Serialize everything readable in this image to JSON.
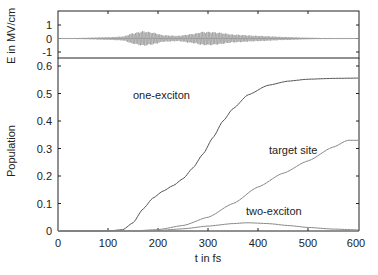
{
  "chart_data": [
    {
      "type": "line",
      "panel": "top",
      "title": "",
      "xlabel": "",
      "ylabel": "E in MV/cm",
      "xlim": [
        0,
        600
      ],
      "ylim": [
        -1.6,
        1.6
      ],
      "yticks": [
        "1",
        "0",
        "-1"
      ],
      "series": [
        {
          "name": "electric field envelope",
          "description": "oscillating pulse train; two main pulses centered near t=170 fs and t=305 fs, amplitude about 0.5 MV/cm",
          "t": [
            0,
            50,
            100,
            130,
            150,
            170,
            190,
            210,
            240,
            270,
            290,
            305,
            320,
            350,
            400,
            450,
            500,
            550,
            600
          ],
          "amplitude": [
            0.0,
            0.05,
            0.1,
            0.15,
            0.4,
            0.55,
            0.45,
            0.25,
            0.2,
            0.35,
            0.5,
            0.5,
            0.45,
            0.3,
            0.2,
            0.12,
            0.06,
            0.02,
            0.0
          ]
        }
      ]
    },
    {
      "type": "line",
      "panel": "bottom",
      "title": "",
      "xlabel": "t in fs",
      "ylabel": "Population",
      "xlim": [
        0,
        600
      ],
      "ylim": [
        0,
        0.6
      ],
      "xticks": [
        "0",
        "100",
        "200",
        "300",
        "400",
        "500",
        "600"
      ],
      "yticks": [
        "0",
        "0.1",
        "0.2",
        "0.3",
        "0.4",
        "0.5",
        "0.6"
      ],
      "grid": false,
      "series": [
        {
          "name": "one-exciton",
          "t": [
            0,
            100,
            130,
            150,
            170,
            190,
            210,
            230,
            250,
            270,
            290,
            310,
            330,
            350,
            380,
            420,
            460,
            500,
            550,
            600
          ],
          "values": [
            0,
            0,
            0.005,
            0.03,
            0.08,
            0.12,
            0.145,
            0.165,
            0.19,
            0.23,
            0.28,
            0.34,
            0.4,
            0.445,
            0.495,
            0.53,
            0.545,
            0.552,
            0.555,
            0.556
          ]
        },
        {
          "name": "target site",
          "t": [
            0,
            150,
            200,
            250,
            300,
            350,
            400,
            450,
            500,
            550,
            580,
            600
          ],
          "values": [
            0,
            0,
            0.005,
            0.02,
            0.05,
            0.1,
            0.16,
            0.21,
            0.255,
            0.305,
            0.33,
            0.33
          ]
        },
        {
          "name": "two-exciton",
          "t": [
            0,
            150,
            200,
            250,
            300,
            350,
            380,
            420,
            460,
            500,
            550,
            600
          ],
          "values": [
            0,
            0,
            0.002,
            0.008,
            0.018,
            0.027,
            0.03,
            0.027,
            0.02,
            0.013,
            0.007,
            0.004
          ]
        }
      ],
      "annotations": [
        {
          "text": "one-exciton",
          "t": 175,
          "value": 0.49
        },
        {
          "text": "target site",
          "t": 405,
          "value": 0.29
        },
        {
          "text": "two-exciton",
          "t": 405,
          "value": 0.06
        }
      ]
    }
  ],
  "labels": {
    "top_ylabel": "E in MV/cm",
    "bottom_ylabel": "Population",
    "xlabel": "t in fs",
    "annot_one": "one-exciton",
    "annot_target": "target site",
    "annot_two": "two-exciton",
    "top_ticks": [
      "1",
      "0",
      "-1"
    ],
    "bottom_yticks": [
      "0",
      "0.1",
      "0.2",
      "0.3",
      "0.4",
      "0.5",
      "0.6"
    ],
    "xticks": [
      "0",
      "100",
      "200",
      "300",
      "400",
      "500",
      "600"
    ]
  },
  "colors": {
    "axis": "#222222",
    "one_exciton": "#555555",
    "target_site": "#888888",
    "two_exciton": "#888888",
    "field": "#8a8a8a"
  }
}
